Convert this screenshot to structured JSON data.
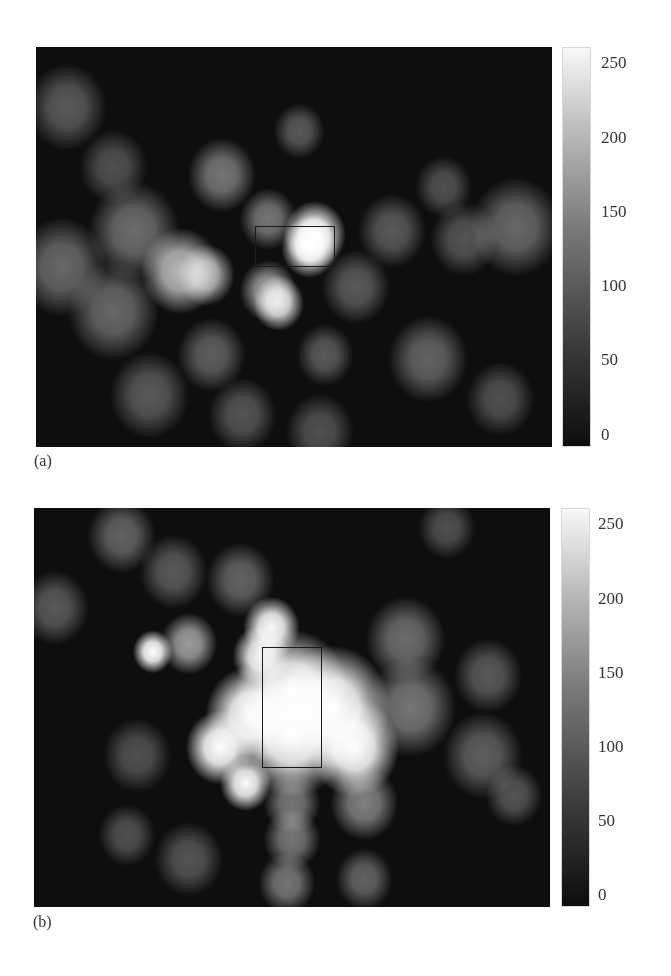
{
  "chart_data": [
    {
      "type": "heatmap",
      "panel_label": "(a)",
      "colormap": "gray",
      "colorbar": {
        "min": 0,
        "max": 255,
        "ticks": [
          "250",
          "200",
          "150",
          "100",
          "50",
          "0"
        ]
      },
      "roi_rectangle": {
        "x0_frac": 0.425,
        "y0_frac": 0.447,
        "x1_frac": 0.578,
        "y1_frac": 0.548,
        "shape": "wide"
      },
      "description": "Grayscale intensity map; single bright hot spot inside right half of rectangle, secondary bright arc left-center and spot below rectangle",
      "blobs": [
        {
          "cx": 0.54,
          "cy": 0.47,
          "r": 0.055,
          "v": 255
        },
        {
          "cx": 0.53,
          "cy": 0.5,
          "r": 0.05,
          "v": 255
        },
        {
          "cx": 0.28,
          "cy": 0.56,
          "r": 0.07,
          "v": 180
        },
        {
          "cx": 0.33,
          "cy": 0.57,
          "r": 0.05,
          "v": 170
        },
        {
          "cx": 0.47,
          "cy": 0.64,
          "r": 0.045,
          "v": 220
        },
        {
          "cx": 0.45,
          "cy": 0.61,
          "r": 0.05,
          "v": 150
        },
        {
          "cx": 0.36,
          "cy": 0.32,
          "r": 0.06,
          "v": 110
        },
        {
          "cx": 0.45,
          "cy": 0.43,
          "r": 0.05,
          "v": 110
        },
        {
          "cx": 0.51,
          "cy": 0.21,
          "r": 0.045,
          "v": 80
        },
        {
          "cx": 0.06,
          "cy": 0.15,
          "r": 0.07,
          "v": 80
        },
        {
          "cx": 0.15,
          "cy": 0.3,
          "r": 0.06,
          "v": 70
        },
        {
          "cx": 0.05,
          "cy": 0.55,
          "r": 0.08,
          "v": 95
        },
        {
          "cx": 0.19,
          "cy": 0.46,
          "r": 0.08,
          "v": 100
        },
        {
          "cx": 0.15,
          "cy": 0.66,
          "r": 0.08,
          "v": 95
        },
        {
          "cx": 0.69,
          "cy": 0.46,
          "r": 0.06,
          "v": 80
        },
        {
          "cx": 0.79,
          "cy": 0.35,
          "r": 0.05,
          "v": 70
        },
        {
          "cx": 0.93,
          "cy": 0.45,
          "r": 0.08,
          "v": 95
        },
        {
          "cx": 0.83,
          "cy": 0.48,
          "r": 0.06,
          "v": 75
        },
        {
          "cx": 0.76,
          "cy": 0.78,
          "r": 0.07,
          "v": 90
        },
        {
          "cx": 0.56,
          "cy": 0.77,
          "r": 0.05,
          "v": 80
        },
        {
          "cx": 0.34,
          "cy": 0.77,
          "r": 0.06,
          "v": 85
        },
        {
          "cx": 0.22,
          "cy": 0.87,
          "r": 0.07,
          "v": 80
        },
        {
          "cx": 0.4,
          "cy": 0.92,
          "r": 0.06,
          "v": 75
        },
        {
          "cx": 0.55,
          "cy": 0.96,
          "r": 0.06,
          "v": 70
        },
        {
          "cx": 0.9,
          "cy": 0.88,
          "r": 0.06,
          "v": 70
        },
        {
          "cx": 0.62,
          "cy": 0.6,
          "r": 0.06,
          "v": 80
        }
      ]
    },
    {
      "type": "heatmap",
      "panel_label": "(b)",
      "colormap": "gray",
      "colorbar": {
        "min": 0,
        "max": 255,
        "ticks": [
          "250",
          "200",
          "150",
          "100",
          "50",
          "0"
        ]
      },
      "roi_rectangle": {
        "x0_frac": 0.442,
        "y0_frac": 0.349,
        "x1_frac": 0.558,
        "y1_frac": 0.65,
        "shape": "tall"
      },
      "description": "Grayscale intensity map; large saturated region filling tall rectangle and surrounding area, bright spots upper-left and below-left",
      "blobs": [
        {
          "cx": 0.5,
          "cy": 0.46,
          "r": 0.1,
          "v": 255
        },
        {
          "cx": 0.5,
          "cy": 0.57,
          "r": 0.1,
          "v": 255
        },
        {
          "cx": 0.58,
          "cy": 0.5,
          "r": 0.1,
          "v": 255
        },
        {
          "cx": 0.62,
          "cy": 0.6,
          "r": 0.08,
          "v": 255
        },
        {
          "cx": 0.42,
          "cy": 0.52,
          "r": 0.08,
          "v": 255
        },
        {
          "cx": 0.36,
          "cy": 0.6,
          "r": 0.06,
          "v": 255
        },
        {
          "cx": 0.46,
          "cy": 0.3,
          "r": 0.05,
          "v": 250
        },
        {
          "cx": 0.44,
          "cy": 0.37,
          "r": 0.05,
          "v": 240
        },
        {
          "cx": 0.41,
          "cy": 0.69,
          "r": 0.045,
          "v": 250
        },
        {
          "cx": 0.23,
          "cy": 0.36,
          "r": 0.035,
          "v": 255
        },
        {
          "cx": 0.3,
          "cy": 0.34,
          "r": 0.05,
          "v": 150
        },
        {
          "cx": 0.17,
          "cy": 0.07,
          "r": 0.06,
          "v": 90
        },
        {
          "cx": 0.27,
          "cy": 0.16,
          "r": 0.06,
          "v": 80
        },
        {
          "cx": 0.4,
          "cy": 0.18,
          "r": 0.06,
          "v": 90
        },
        {
          "cx": 0.04,
          "cy": 0.25,
          "r": 0.06,
          "v": 80
        },
        {
          "cx": 0.72,
          "cy": 0.33,
          "r": 0.07,
          "v": 100
        },
        {
          "cx": 0.73,
          "cy": 0.5,
          "r": 0.08,
          "v": 110
        },
        {
          "cx": 0.88,
          "cy": 0.42,
          "r": 0.06,
          "v": 80
        },
        {
          "cx": 0.87,
          "cy": 0.62,
          "r": 0.07,
          "v": 85
        },
        {
          "cx": 0.93,
          "cy": 0.72,
          "r": 0.05,
          "v": 75
        },
        {
          "cx": 0.5,
          "cy": 0.74,
          "r": 0.05,
          "v": 110
        },
        {
          "cx": 0.64,
          "cy": 0.74,
          "r": 0.06,
          "v": 120
        },
        {
          "cx": 0.5,
          "cy": 0.83,
          "r": 0.05,
          "v": 110
        },
        {
          "cx": 0.49,
          "cy": 0.94,
          "r": 0.05,
          "v": 110
        },
        {
          "cx": 0.64,
          "cy": 0.93,
          "r": 0.05,
          "v": 90
        },
        {
          "cx": 0.18,
          "cy": 0.82,
          "r": 0.05,
          "v": 70
        },
        {
          "cx": 0.3,
          "cy": 0.88,
          "r": 0.06,
          "v": 75
        },
        {
          "cx": 0.8,
          "cy": 0.05,
          "r": 0.05,
          "v": 70
        },
        {
          "cx": 0.2,
          "cy": 0.62,
          "r": 0.06,
          "v": 70
        }
      ]
    }
  ],
  "panels": [
    {
      "label": "(a)",
      "ticks": [
        "250",
        "200",
        "150",
        "100",
        "50",
        "0"
      ]
    },
    {
      "label": "(b)",
      "ticks": [
        "250",
        "200",
        "150",
        "100",
        "50",
        "0"
      ]
    }
  ]
}
